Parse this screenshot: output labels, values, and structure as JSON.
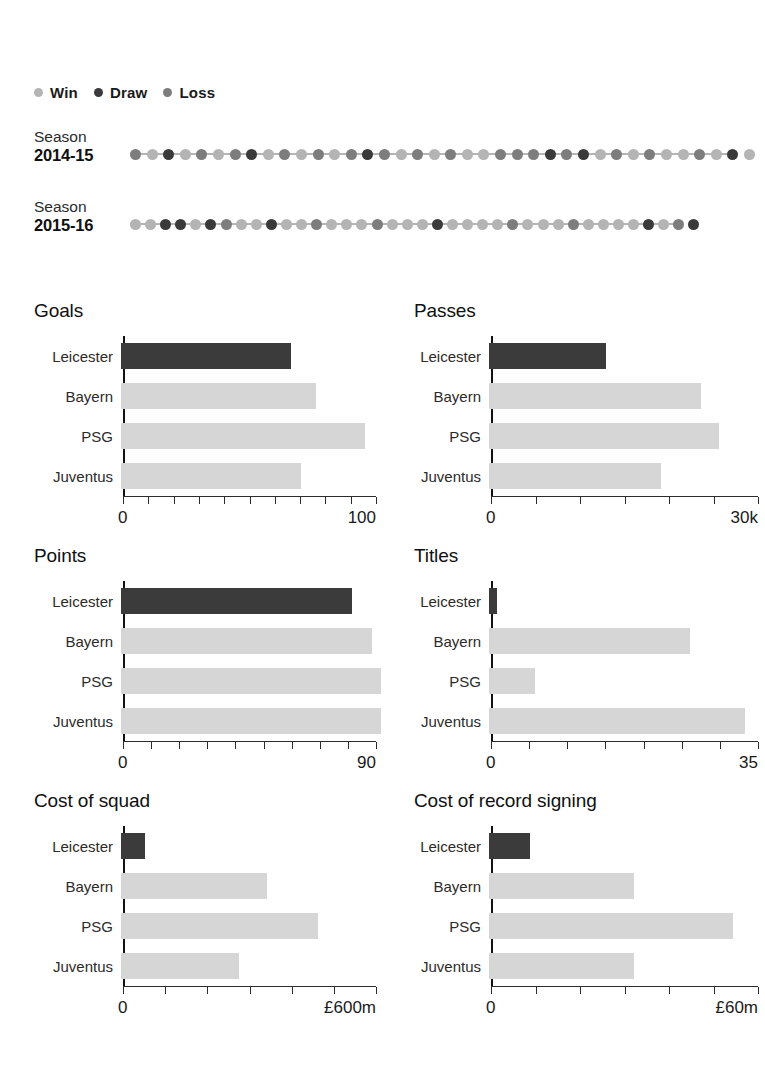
{
  "legend": {
    "items": [
      {
        "label": "Win",
        "color": "#b4b4b4",
        "icon": "circle-dot-icon"
      },
      {
        "label": "Draw",
        "color": "#3a3a3a",
        "icon": "circle-dot-icon"
      },
      {
        "label": "Loss",
        "color": "#7d7d7d",
        "icon": "circle-dot-icon"
      }
    ]
  },
  "colors": {
    "win": "#b4b4b4",
    "draw": "#3a3a3a",
    "loss": "#7d7d7d",
    "highlight_bar": "#3b3b3b",
    "other_bar": "#d6d6d6",
    "axis": "#1a1a1a"
  },
  "seasons": [
    {
      "word": "Season",
      "years": "2014-15",
      "matches": 38,
      "results": [
        "L",
        "W",
        "D",
        "W",
        "L",
        "W",
        "L",
        "D",
        "W",
        "L",
        "W",
        "L",
        "W",
        "L",
        "D",
        "L",
        "W",
        "L",
        "W",
        "L",
        "W",
        "W",
        "L",
        "L",
        "L",
        "D",
        "L",
        "D",
        "W",
        "L",
        "W",
        "L",
        "W",
        "W",
        "L",
        "W",
        "D",
        "W"
      ]
    },
    {
      "word": "Season",
      "years": "2015-16",
      "matches": 38,
      "results": [
        "W",
        "W",
        "D",
        "D",
        "W",
        "D",
        "L",
        "W",
        "W",
        "D",
        "W",
        "W",
        "L",
        "W",
        "W",
        "W",
        "L",
        "W",
        "W",
        "W",
        "D",
        "W",
        "W",
        "W",
        "W",
        "L",
        "W",
        "W",
        "W",
        "L",
        "W",
        "W",
        "W",
        "W",
        "D",
        "W",
        "L",
        "D"
      ]
    }
  ],
  "chart_data": [
    {
      "type": "bar",
      "title": "Goals",
      "orientation": "horizontal",
      "categories": [
        "Leicester",
        "Bayern",
        "PSG",
        "Juventus"
      ],
      "values": [
        66,
        76,
        95,
        70
      ],
      "highlight": "Leicester",
      "xlim": [
        0,
        100
      ],
      "tick_count": 10,
      "axis_min_label": "0",
      "axis_max_label": "100",
      "xlabel": "",
      "ylabel": "",
      "grid": false,
      "legend": "none"
    },
    {
      "type": "bar",
      "title": "Passes",
      "orientation": "horizontal",
      "categories": [
        "Leicester",
        "Bayern",
        "PSG",
        "Juventus"
      ],
      "values": [
        13000,
        23500,
        25500,
        19000
      ],
      "highlight": "Leicester",
      "xlim": [
        0,
        30000
      ],
      "tick_count": 6,
      "axis_min_label": "0",
      "axis_max_label": "30k",
      "xlabel": "",
      "ylabel": "",
      "grid": false,
      "legend": "none"
    },
    {
      "type": "bar",
      "title": "Points",
      "orientation": "horizontal",
      "categories": [
        "Leicester",
        "Bayern",
        "PSG",
        "Juventus"
      ],
      "values": [
        81,
        88,
        91,
        91
      ],
      "highlight": "Leicester",
      "xlim": [
        0,
        90
      ],
      "tick_count": 9,
      "axis_min_label": "0",
      "axis_max_label": "90",
      "xlabel": "",
      "ylabel": "",
      "grid": false,
      "legend": "none"
    },
    {
      "type": "bar",
      "title": "Titles",
      "orientation": "horizontal",
      "categories": [
        "Leicester",
        "Bayern",
        "PSG",
        "Juventus"
      ],
      "values": [
        1,
        26,
        6,
        33
      ],
      "highlight": "Leicester",
      "xlim": [
        0,
        35
      ],
      "tick_count": 7,
      "axis_min_label": "0",
      "axis_max_label": "35",
      "xlabel": "",
      "ylabel": "",
      "grid": false,
      "legend": "none"
    },
    {
      "type": "bar",
      "title": "Cost of squad",
      "orientation": "horizontal",
      "categories": [
        "Leicester",
        "Bayern",
        "PSG",
        "Juventus"
      ],
      "values": [
        55,
        340,
        460,
        275
      ],
      "highlight": "Leicester",
      "xlim": [
        0,
        600
      ],
      "tick_count": 6,
      "axis_min_label": "0",
      "axis_max_label": "£600m",
      "xlabel": "",
      "ylabel": "",
      "grid": false,
      "legend": "none"
    },
    {
      "type": "bar",
      "title": "Cost of record signing",
      "orientation": "horizontal",
      "categories": [
        "Leicester",
        "Bayern",
        "PSG",
        "Juventus"
      ],
      "values": [
        9,
        32,
        54,
        32
      ],
      "highlight": "Leicester",
      "xlim": [
        0,
        60
      ],
      "tick_count": 6,
      "axis_min_label": "0",
      "axis_max_label": "£60m",
      "xlabel": "",
      "ylabel": "",
      "grid": false,
      "legend": "none"
    }
  ]
}
